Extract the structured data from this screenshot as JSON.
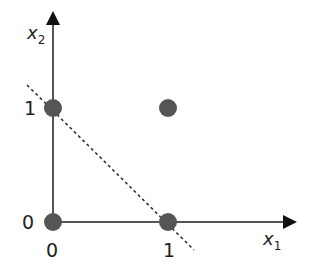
{
  "diagram": {
    "axes": {
      "x_label": "x",
      "x_sub": "1",
      "y_label": "x",
      "y_sub": "2",
      "x_ticks": [
        "0",
        "1"
      ],
      "y_ticks": [
        "0",
        "1"
      ]
    },
    "points": [
      {
        "x": 0,
        "y": 0
      },
      {
        "x": 1,
        "y": 0
      },
      {
        "x": 0,
        "y": 1
      },
      {
        "x": 1,
        "y": 1
      }
    ],
    "decision_line": {
      "style": "dashed",
      "from": [
        -0.23,
        1.2
      ],
      "to": [
        1.23,
        -0.23
      ]
    },
    "colors": {
      "point": "#555555",
      "axis": "#555555",
      "line": "#333333"
    }
  }
}
